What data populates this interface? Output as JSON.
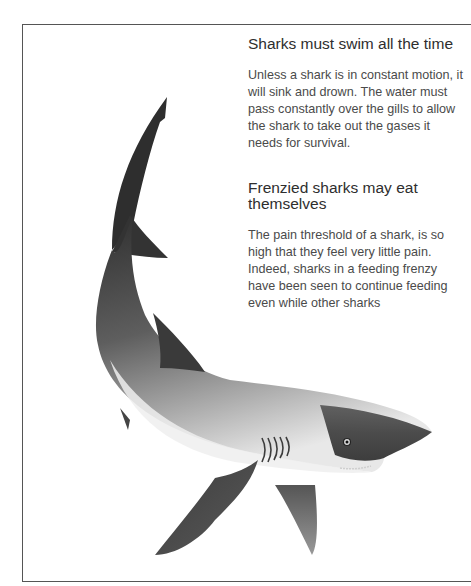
{
  "sections": [
    {
      "heading": "Sharks must swim all the time",
      "body": "Unless a shark is in constant motion, it will sink and drown. The water must pass constantly over the gills to allow the shark to take out the gases it needs for survival."
    },
    {
      "heading": "Frenzied sharks may eat themselves",
      "body": "The pain threshold of a shark, is so high that they feel very little pain. Indeed, sharks in a feeding frenzy have been seen to continue feeding even while other sharks"
    }
  ],
  "illustration": {
    "subject": "shark-illustration",
    "colors": {
      "dark": "#2b2b2b",
      "mid": "#6e6e6e",
      "belly": "#e6e6e6",
      "frame": "#555555"
    }
  }
}
